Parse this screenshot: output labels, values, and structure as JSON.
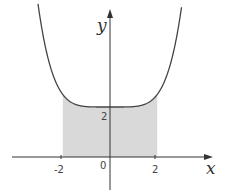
{
  "chart_data": {
    "type": "area",
    "title": "",
    "xlabel": "x",
    "ylabel": "y",
    "function": "y = 2 + c·|x|^n (even function, minimum 2 at x=0)",
    "shaded_region": {
      "x_from": -2,
      "x_to": 2,
      "description": "area under curve between x=-2 and x=2"
    },
    "x_ticks": [
      "-2",
      "0",
      "2"
    ],
    "y_ticks": [
      "2"
    ],
    "xlim": [
      -4.5,
      4.8
    ],
    "ylim": [
      -1.5,
      6.2
    ],
    "points": [
      {
        "x": -3,
        "y": 5.8
      },
      {
        "x": -2.5,
        "y": 3.5
      },
      {
        "x": -2,
        "y": 2.5
      },
      {
        "x": -1,
        "y": 2.02
      },
      {
        "x": 0,
        "y": 2
      },
      {
        "x": 1,
        "y": 2.02
      },
      {
        "x": 2,
        "y": 2.5
      },
      {
        "x": 2.5,
        "y": 3.5
      },
      {
        "x": 3,
        "y": 5.8
      }
    ],
    "colors": {
      "curve": "#444444",
      "fill": "#d9d9d9",
      "axes": "#333333"
    },
    "grid": false,
    "legend": null
  },
  "labels": {
    "x_axis": "x",
    "y_axis": "y",
    "origin": "0",
    "x_neg2": "-2",
    "x_pos2": "2",
    "y_2": "2"
  }
}
